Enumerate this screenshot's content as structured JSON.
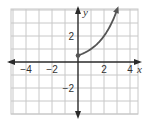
{
  "chart_data": {
    "type": "line",
    "title": "",
    "xlabel": "x",
    "ylabel": "y",
    "xlim": [
      -5,
      4.6
    ],
    "ylim": [
      -4,
      4.1
    ],
    "grid": true,
    "x_ticks": [
      -4,
      -2,
      2,
      4
    ],
    "y_ticks": [
      2,
      -2
    ],
    "x_tick_labels": [
      "−4",
      "−2",
      "2",
      "4"
    ],
    "y_tick_labels": [
      "2",
      "−2"
    ],
    "series": [
      {
        "name": "y = 0.5 · 2^x",
        "x": [
          0,
          0.5,
          1,
          1.5,
          2,
          2.5,
          3,
          3.1
        ],
        "y": [
          0.5,
          0.71,
          1,
          1.41,
          2,
          2.83,
          4,
          4.29
        ],
        "start_point": {
          "x": 0,
          "y": 0.5,
          "filled": true
        },
        "end_arrow": true
      }
    ],
    "colors": {
      "grid": "#c8c8c8",
      "axis": "#2a2a2a",
      "curve": "#555555"
    }
  }
}
